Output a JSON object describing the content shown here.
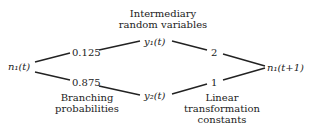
{
  "nodes": {
    "source": "n₁(t)",
    "y1": "y₁(t)",
    "y2": "y₂(t)",
    "target": "n₁(t+1)"
  },
  "edges": {
    "source_y1": "0.125",
    "source_y2": "0.875",
    "y1_target": "2",
    "y2_target": "1"
  },
  "annotations": {
    "top_line1": "Intermediary",
    "top_line2": "random variables",
    "left_line1": "Branching",
    "left_line2": "probabilities",
    "right_line1": "Linear",
    "right_line2": "transformation",
    "right_line3": "constants"
  }
}
